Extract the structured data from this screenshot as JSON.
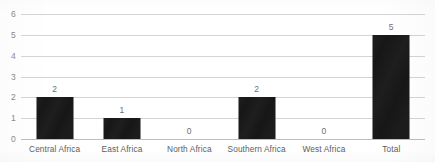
{
  "chart_data": {
    "type": "bar",
    "title": "",
    "subtitle": "",
    "xlabel": "",
    "ylabel": "",
    "categories": [
      "Central Africa",
      "East Africa",
      "North Africa",
      "Southern Africa",
      "West Africa",
      "Total"
    ],
    "values": [
      2,
      1,
      0,
      2,
      0,
      5
    ],
    "data_labels": [
      "2",
      "1",
      "0",
      "2",
      "0",
      "5"
    ],
    "ylim": [
      0,
      6
    ],
    "ytick_labels": [
      "0",
      "1",
      "2",
      "3",
      "4",
      "5",
      "6"
    ],
    "ytick_values": [
      0,
      1,
      2,
      3,
      4,
      5,
      6
    ],
    "grid": true,
    "grid_axis": "y",
    "legend": false,
    "legend_position": "none",
    "bar_color": "#171717",
    "gridline_color": "#d4d4d4",
    "tick_label_color": "#8a8a8a",
    "background_color": "#ffffff"
  }
}
